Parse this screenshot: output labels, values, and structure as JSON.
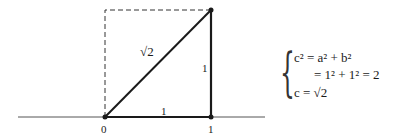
{
  "diagram": {
    "labels": {
      "origin": "0",
      "one_x": "1",
      "base_side": "1",
      "vertical_side": "1",
      "hypotenuse": "√2"
    },
    "colors": {
      "stroke": "#1a1a1a",
      "dashed": "#333333"
    }
  },
  "equations": {
    "line1": "c² = a² + b²",
    "line2": "= 1² + 1² = 2",
    "line3": "c = √2"
  }
}
